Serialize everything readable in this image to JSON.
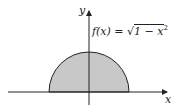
{
  "diagram": {
    "function_label": "f(x) = √1 − x²",
    "function_prefix": "f(x) = ",
    "function_radicand": "1 − x",
    "function_exponent": "2",
    "x_axis_label": "x",
    "y_axis_label": "y",
    "shape": "upper semicircle of radius 1 centered at origin",
    "fill_color": "#c8c8c8",
    "stroke_color": "#222222"
  }
}
